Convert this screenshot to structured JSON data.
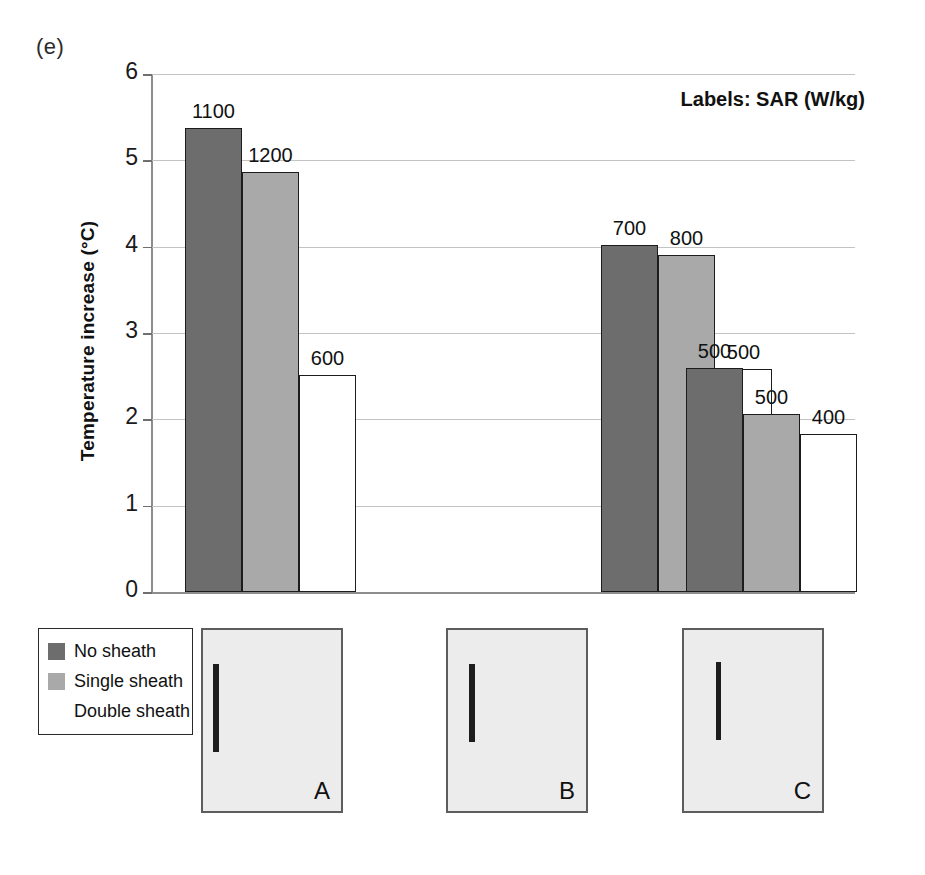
{
  "figure": {
    "panel_label": "(e)",
    "annotation": "Labels: SAR (W/kg)",
    "y_axis_title": "Temperature increase (°C)"
  },
  "legend": {
    "items": [
      {
        "label": "No sheath",
        "color": "#6d6d6d"
      },
      {
        "label": "Single sheath",
        "color": "#a9a9a9"
      },
      {
        "label": "Double sheath",
        "color": "#ffffff"
      }
    ]
  },
  "photo_panels": [
    {
      "letter": "A"
    },
    {
      "letter": "B"
    },
    {
      "letter": "C"
    }
  ],
  "chart_data": {
    "type": "bar",
    "title": "",
    "xlabel": "",
    "ylabel": "Temperature increase (°C)",
    "ylim": [
      0,
      6
    ],
    "yticks": [
      "0",
      "1",
      "2",
      "3",
      "4",
      "5",
      "6"
    ],
    "grid": true,
    "legend_position": "bottom-left-outside",
    "annotation": "Labels: SAR (W/kg)",
    "categories": [
      "A",
      "B",
      "C"
    ],
    "series": [
      {
        "name": "No sheath",
        "color": "#6d6d6d",
        "values": [
          5.38,
          4.02,
          2.6
        ],
        "labels": [
          "1100",
          "700",
          "500"
        ]
      },
      {
        "name": "Single sheath",
        "color": "#a9a9a9",
        "values": [
          4.87,
          3.9,
          2.06
        ],
        "labels": [
          "1200",
          "800",
          "500"
        ]
      },
      {
        "name": "Double sheath",
        "color": "#ffffff",
        "values": [
          2.51,
          2.58,
          1.83
        ],
        "labels": [
          "600",
          "500",
          "400"
        ]
      }
    ]
  }
}
